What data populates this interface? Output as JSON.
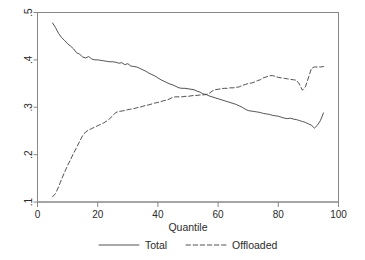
{
  "chart_data": {
    "type": "line",
    "title": "",
    "xlabel": "Quantile",
    "ylabel": "",
    "xlim": [
      0,
      100
    ],
    "ylim": [
      0.1,
      0.5
    ],
    "xticks": [
      0,
      20,
      40,
      60,
      80,
      100
    ],
    "xtick_labels": [
      "0",
      "20",
      "40",
      "60",
      "80",
      "100"
    ],
    "yticks": [
      0.1,
      0.2,
      0.3,
      0.4,
      0.5
    ],
    "ytick_labels": [
      ".1",
      ".2",
      ".3",
      ".4",
      ".5"
    ],
    "grid": false,
    "legend_position": "bottom",
    "series": [
      {
        "name": "Total",
        "style": "solid",
        "color": "#404040",
        "x": [
          5,
          6,
          7,
          8,
          9,
          10,
          11,
          12,
          13,
          14,
          15,
          16,
          17,
          18,
          19,
          20,
          21,
          22,
          23,
          24,
          25,
          26,
          27,
          28,
          29,
          30,
          31,
          32,
          33,
          34,
          35,
          36,
          37,
          38,
          39,
          40,
          41,
          42,
          43,
          44,
          45,
          46,
          47,
          48,
          49,
          50,
          51,
          52,
          53,
          54,
          55,
          56,
          57,
          58,
          59,
          60,
          61,
          62,
          63,
          64,
          65,
          66,
          67,
          68,
          69,
          70,
          71,
          72,
          73,
          74,
          75,
          76,
          77,
          78,
          79,
          80,
          81,
          82,
          83,
          84,
          85,
          86,
          87,
          88,
          89,
          90,
          91,
          92,
          93,
          94,
          95
        ],
        "values": [
          0.478,
          0.468,
          0.456,
          0.447,
          0.441,
          0.434,
          0.429,
          0.423,
          0.415,
          0.412,
          0.406,
          0.404,
          0.407,
          0.402,
          0.4,
          0.4,
          0.399,
          0.398,
          0.397,
          0.396,
          0.396,
          0.395,
          0.393,
          0.394,
          0.39,
          0.392,
          0.387,
          0.386,
          0.385,
          0.382,
          0.379,
          0.376,
          0.372,
          0.369,
          0.366,
          0.362,
          0.358,
          0.355,
          0.352,
          0.349,
          0.347,
          0.344,
          0.341,
          0.34,
          0.34,
          0.339,
          0.338,
          0.337,
          0.334,
          0.332,
          0.328,
          0.327,
          0.324,
          0.322,
          0.32,
          0.318,
          0.316,
          0.314,
          0.312,
          0.31,
          0.308,
          0.306,
          0.303,
          0.3,
          0.296,
          0.293,
          0.292,
          0.291,
          0.29,
          0.289,
          0.287,
          0.286,
          0.285,
          0.283,
          0.282,
          0.281,
          0.279,
          0.277,
          0.276,
          0.277,
          0.275,
          0.274,
          0.272,
          0.27,
          0.268,
          0.265,
          0.262,
          0.256,
          0.262,
          0.272,
          0.288
        ]
      },
      {
        "name": "Offloaded",
        "style": "dashed",
        "color": "#404040",
        "x": [
          5,
          6,
          7,
          8,
          9,
          10,
          11,
          12,
          13,
          14,
          15,
          16,
          17,
          18,
          19,
          20,
          21,
          22,
          23,
          24,
          25,
          26,
          27,
          28,
          29,
          30,
          31,
          32,
          33,
          34,
          35,
          36,
          37,
          38,
          39,
          40,
          41,
          42,
          43,
          44,
          45,
          46,
          47,
          48,
          49,
          50,
          51,
          52,
          53,
          54,
          55,
          56,
          57,
          58,
          59,
          60,
          61,
          62,
          63,
          64,
          65,
          66,
          67,
          68,
          69,
          70,
          71,
          72,
          73,
          74,
          75,
          76,
          77,
          78,
          79,
          80,
          81,
          82,
          83,
          84,
          85,
          86,
          87,
          88,
          89,
          90,
          91,
          92,
          93,
          94,
          95
        ],
        "values": [
          0.111,
          0.118,
          0.132,
          0.148,
          0.163,
          0.177,
          0.19,
          0.203,
          0.215,
          0.228,
          0.24,
          0.248,
          0.252,
          0.255,
          0.258,
          0.261,
          0.264,
          0.267,
          0.271,
          0.276,
          0.282,
          0.289,
          0.291,
          0.292,
          0.293,
          0.295,
          0.296,
          0.297,
          0.299,
          0.3,
          0.302,
          0.304,
          0.305,
          0.307,
          0.309,
          0.31,
          0.312,
          0.314,
          0.315,
          0.318,
          0.321,
          0.322,
          0.322,
          0.322,
          0.323,
          0.323,
          0.324,
          0.325,
          0.325,
          0.326,
          0.326,
          0.327,
          0.329,
          0.334,
          0.337,
          0.338,
          0.339,
          0.34,
          0.34,
          0.341,
          0.341,
          0.342,
          0.343,
          0.346,
          0.348,
          0.35,
          0.351,
          0.353,
          0.356,
          0.358,
          0.362,
          0.364,
          0.366,
          0.367,
          0.365,
          0.363,
          0.362,
          0.361,
          0.36,
          0.359,
          0.358,
          0.357,
          0.349,
          0.336,
          0.343,
          0.362,
          0.382,
          0.385,
          0.385,
          0.385,
          0.386
        ]
      }
    ]
  },
  "legend": {
    "items": [
      {
        "label": "Total",
        "style": "solid"
      },
      {
        "label": "Offloaded",
        "style": "dashed"
      }
    ]
  },
  "axes": {
    "x_title": "Quantile"
  },
  "colors": {
    "line": "#404040",
    "frame": "#777777",
    "text": "#2b2b2b",
    "background": "#ffffff"
  }
}
